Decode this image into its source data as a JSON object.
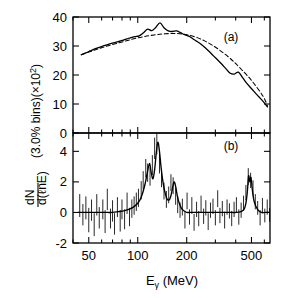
{
  "figure": {
    "ylabel_line1": "dN",
    "ylabel_line2": "d(",
    "ylabel_line2b": "nE)",
    "ylabel_script": "ℓ",
    "ylabel_rest": "(3.0% bins)(×10",
    "ylabel_exp": "2",
    "ylabel_close": ")",
    "xlabel_main": "E",
    "xlabel_sub": "γ",
    "xlabel_unit": "(MeV)",
    "panel_a_label": "(a)",
    "panel_b_label": "(b)",
    "line_color": "#000000",
    "dashed_color": "#000000",
    "axis_color": "#000000"
  },
  "chart_data": {
    "type": "line",
    "title": "",
    "xlabel": "Eγ  (MeV)",
    "ylabel": "dN/d(ℓnE) (3.0% bins)(×10^2)",
    "xscale": "log",
    "xlim": [
      40,
      650
    ],
    "xticks": [
      50,
      100,
      200,
      500
    ],
    "xticklabels": [
      "50",
      "100",
      "200",
      "500"
    ],
    "grid": false,
    "legend": "none",
    "panels": [
      {
        "label": "(a)",
        "ylim": [
          0,
          40
        ],
        "yticks": [
          0,
          10,
          20,
          30,
          40
        ],
        "yticklabels": [
          "0",
          "10",
          "20",
          "30",
          "40"
        ],
        "series": [
          {
            "name": "data-spectrum",
            "style": "solid",
            "x": [
              45,
              48,
              51,
              54,
              58,
              62,
              66,
              70,
              75,
              80,
              85,
              90,
              96,
              102,
              108,
              115,
              122,
              129,
              137,
              145,
              154,
              163,
              173,
              183,
              194,
              206,
              218,
              231,
              245,
              260,
              276,
              292,
              310,
              329,
              349,
              370,
              392,
              416,
              441,
              467,
              496,
              526,
              557,
              591,
              627
            ],
            "y": [
              27.0,
              27.6,
              28.3,
              28.9,
              29.5,
              30.1,
              30.6,
              31.0,
              31.4,
              31.9,
              32.4,
              32.8,
              33.2,
              33.5,
              34.5,
              35.8,
              35.3,
              36.4,
              38.0,
              36.3,
              35.2,
              35.0,
              35.2,
              34.6,
              33.9,
              33.4,
              32.5,
              31.6,
              30.6,
              29.4,
              28.0,
              26.6,
              25.2,
              23.7,
              22.1,
              20.6,
              20.3,
              21.0,
              19.1,
              17.2,
              15.5,
              13.9,
              12.4,
              10.8,
              9.0
            ]
          },
          {
            "name": "fit-dashed",
            "style": "dashed",
            "x": [
              45,
              55,
              65,
              78,
              92,
              108,
              126,
              147,
              172,
              200,
              234,
              273,
              318,
              372,
              434,
              506,
              590,
              627
            ],
            "y": [
              27.0,
              28.7,
              30.0,
              31.2,
              32.3,
              33.2,
              33.8,
              34.2,
              34.3,
              33.9,
              32.8,
              31.0,
              28.6,
              25.6,
              21.9,
              17.8,
              12.6,
              9.3
            ]
          }
        ]
      },
      {
        "label": "(b)",
        "ylim": [
          -2,
          5.2
        ],
        "yticks": [
          -2,
          0,
          2,
          4
        ],
        "yticklabels": [
          "-2",
          "0",
          "2",
          "4"
        ],
        "description": "Residual spectrum dN/d(lnE) after subtracting smooth background; four peaks near 120, 140, 170 and 480 MeV with statistical error bars on each bin.",
        "series": [
          {
            "name": "residual-smooth-curve",
            "style": "solid",
            "x": [
              43,
              47,
              51,
              55,
              60,
              65,
              70,
              76,
              82,
              88,
              94,
              100,
              105,
              110,
              114,
              118,
              121,
              124,
              127,
              130,
              133,
              136,
              139,
              142,
              145,
              148,
              151,
              155,
              159,
              163,
              167,
              171,
              175,
              180,
              186,
              193,
              200,
              210,
              225,
              240,
              260,
              285,
              310,
              340,
              375,
              405,
              430,
              450,
              462,
              472,
              480,
              488,
              496,
              506,
              520,
              545,
              575,
              610,
              640
            ],
            "y": [
              0.0,
              0.0,
              0.0,
              0.0,
              0.0,
              0.0,
              0.0,
              0.05,
              0.1,
              0.2,
              0.35,
              0.6,
              1.0,
              1.7,
              2.5,
              3.2,
              2.6,
              2.2,
              2.8,
              3.9,
              4.6,
              4.0,
              3.0,
              2.2,
              1.6,
              1.2,
              0.9,
              0.8,
              1.0,
              1.5,
              2.0,
              1.7,
              1.1,
              0.6,
              0.25,
              0.1,
              0.0,
              0.0,
              0.0,
              0.0,
              0.0,
              0.0,
              0.0,
              0.0,
              0.0,
              0.0,
              0.05,
              0.2,
              0.6,
              1.4,
              2.4,
              2.0,
              2.3,
              1.5,
              0.7,
              0.2,
              0.0,
              0.0,
              0.0
            ]
          }
        ],
        "errorbars": {
          "note": "one vertical error bar per 3.0% logarithmic energy bin",
          "x": [
            44,
            46,
            48,
            50,
            52,
            54,
            56,
            58,
            61,
            63,
            65,
            68,
            70,
            72,
            75,
            78,
            80,
            83,
            86,
            89,
            92,
            95,
            98,
            101,
            105,
            108,
            112,
            115,
            119,
            123,
            127,
            131,
            136,
            140,
            145,
            150,
            155,
            160,
            165,
            171,
            176,
            182,
            188,
            195,
            201,
            208,
            215,
            222,
            230,
            237,
            245,
            254,
            262,
            271,
            280,
            290,
            300,
            310,
            320,
            331,
            342,
            354,
            366,
            378,
            391,
            404,
            418,
            432,
            447,
            462,
            478,
            494,
            511,
            528,
            546,
            565,
            584,
            604,
            625,
            646
          ],
          "center": [
            0.45,
            -0.15,
            0.3,
            -0.5,
            0.15,
            -0.8,
            0.5,
            -0.35,
            0.2,
            -0.6,
            0.85,
            -0.4,
            0.1,
            -0.75,
            0.35,
            -0.55,
            0.2,
            -0.45,
            0.6,
            -0.3,
            0.25,
            0.45,
            0.7,
            0.95,
            1.45,
            2.1,
            2.9,
            2.6,
            2.35,
            3.1,
            4.2,
            4.5,
            3.2,
            2.25,
            1.4,
            0.85,
            1.15,
            1.95,
            1.75,
            1.05,
            0.5,
            0.15,
            0.35,
            -0.5,
            0.75,
            -0.3,
            0.45,
            -0.65,
            0.2,
            -0.4,
            0.55,
            -0.25,
            0.3,
            -0.6,
            0.15,
            0.4,
            -0.35,
            0.9,
            -0.2,
            0.25,
            -0.5,
            0.35,
            0.1,
            -0.4,
            0.2,
            0.5,
            -0.3,
            0.15,
            0.6,
            1.3,
            2.35,
            2.1,
            1.6,
            0.7,
            0.3,
            -0.35,
            0.45,
            -0.2,
            0.35,
            -0.15
          ],
          "err": [
            0.75,
            0.7,
            0.75,
            0.8,
            0.7,
            0.75,
            0.7,
            0.7,
            0.65,
            0.75,
            0.7,
            0.65,
            0.7,
            0.7,
            0.65,
            0.7,
            0.65,
            0.65,
            0.7,
            0.6,
            0.6,
            0.6,
            0.6,
            0.6,
            0.6,
            0.6,
            0.6,
            0.6,
            0.6,
            0.65,
            0.7,
            0.7,
            0.65,
            0.6,
            0.55,
            0.55,
            0.55,
            0.55,
            0.55,
            0.55,
            0.55,
            0.5,
            0.55,
            0.55,
            0.55,
            0.5,
            0.55,
            0.55,
            0.5,
            0.5,
            0.55,
            0.5,
            0.5,
            0.55,
            0.5,
            0.5,
            0.5,
            0.55,
            0.5,
            0.5,
            0.55,
            0.5,
            0.5,
            0.5,
            0.5,
            0.5,
            0.5,
            0.5,
            0.5,
            0.5,
            0.55,
            0.5,
            0.5,
            0.5,
            0.45,
            0.5,
            0.5,
            0.45,
            0.5,
            0.45
          ]
        }
      }
    ]
  }
}
